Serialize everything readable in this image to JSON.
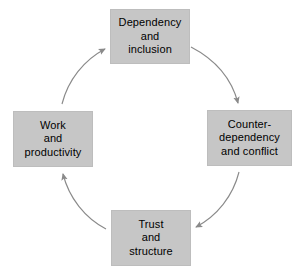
{
  "diagram": {
    "type": "cycle",
    "title": "",
    "direction": "clockwise",
    "background_color": "#ffffff",
    "node_fill_color": "#c6c6c6",
    "node_text_color": "#000000",
    "arrow_color": "#8a8a8a",
    "nodes": [
      {
        "id": "dependency-and-inclusion",
        "position": "top",
        "lines": [
          "Dependency",
          "and",
          "inclusion"
        ]
      },
      {
        "id": "counter-dependency-and-conflict",
        "position": "right",
        "lines": [
          "Counter-",
          "dependency",
          "and conflict"
        ]
      },
      {
        "id": "trust-and-structure",
        "position": "bottom",
        "lines": [
          "Trust",
          "and",
          "structure"
        ]
      },
      {
        "id": "work-and-productivity",
        "position": "left",
        "lines": [
          "Work",
          "and",
          "productivity"
        ]
      }
    ],
    "arrows": [
      {
        "id": "arrow-top-to-right",
        "from": "dependency-and-inclusion",
        "to": "counter-dependency-and-conflict"
      },
      {
        "id": "arrow-right-to-bottom",
        "from": "counter-dependency-and-conflict",
        "to": "trust-and-structure"
      },
      {
        "id": "arrow-bottom-to-left",
        "from": "trust-and-structure",
        "to": "work-and-productivity"
      },
      {
        "id": "arrow-left-to-top",
        "from": "work-and-productivity",
        "to": "dependency-and-inclusion"
      }
    ]
  }
}
